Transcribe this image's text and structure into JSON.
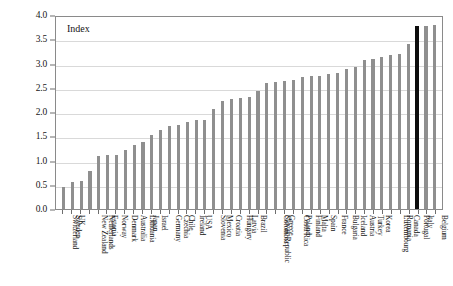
{
  "chart_data": {
    "type": "bar",
    "title": "Index",
    "xlabel": "",
    "ylabel": "",
    "ylim": [
      0,
      4.0
    ],
    "ytick_labels": [
      "0.0",
      "0.5",
      "1.0",
      "1.5",
      "2.0",
      "2.5",
      "3.0",
      "3.5",
      "4.0"
    ],
    "ytick_values": [
      0.0,
      0.5,
      1.0,
      1.5,
      2.0,
      2.5,
      3.0,
      3.5,
      4.0
    ],
    "grid": true,
    "legend": "none",
    "bar_color": "#8f8f8f",
    "highlight_color": "#0d0d0d",
    "highlight_category": "Portugal",
    "categories": [
      "Switzerland",
      "Sweden",
      "UK",
      "New Zealand",
      "Netherlands",
      "Estonia",
      "Norway",
      "Denmark",
      "Australia",
      "Lithuania",
      "Japan",
      "Israel",
      "Germany",
      "Czechia",
      "Chile",
      "Ireland",
      "USA",
      "Slovenia",
      "Mexico",
      "Croatia",
      "Hungary",
      "Latvia",
      "Brazil",
      "Slovak Republic",
      "Colombia",
      "Greece",
      "Costa Rica",
      "Poland",
      "Finland",
      "Malta",
      "Spain",
      "France",
      "Bulgaria",
      "Iceland",
      "Austria",
      "Turkey",
      "Korea",
      "Luxembourg",
      "Romania",
      "Canada",
      "Portugal",
      "Italy",
      "Belgium"
    ],
    "values": [
      0.45,
      0.55,
      0.58,
      0.78,
      1.1,
      1.12,
      1.12,
      1.21,
      1.33,
      1.38,
      1.52,
      1.62,
      1.72,
      1.74,
      1.8,
      1.83,
      1.84,
      2.06,
      2.23,
      2.26,
      2.28,
      2.3,
      2.44,
      2.59,
      2.62,
      2.63,
      2.66,
      2.72,
      2.74,
      2.74,
      2.78,
      2.8,
      2.88,
      2.92,
      3.08,
      3.1,
      3.13,
      3.17,
      3.19,
      3.4,
      3.77,
      3.77,
      3.8
    ]
  }
}
